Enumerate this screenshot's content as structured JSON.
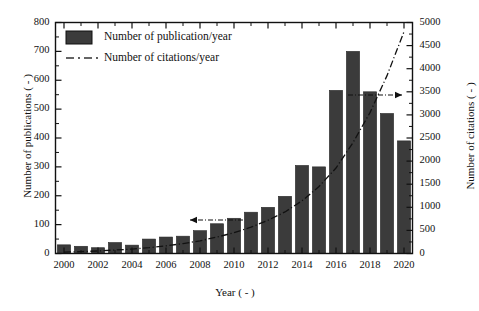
{
  "chart_data": {
    "type": "bar",
    "title": "",
    "xlabel": "Year ( - )",
    "ylabel": "Number of publications ( - )",
    "ylabel_right": "Number of citations ( - )",
    "xlim": [
      1999.5,
      2020.5
    ],
    "ylim": [
      0,
      800
    ],
    "ylim_right": [
      0,
      5000
    ],
    "grid": false,
    "legend_position": "upper-left-inside",
    "categories": [
      2000,
      2001,
      2002,
      2003,
      2004,
      2005,
      2006,
      2007,
      2008,
      2009,
      2010,
      2011,
      2012,
      2013,
      2014,
      2015,
      2016,
      2017,
      2018,
      2019,
      2020
    ],
    "xticks": [
      2000,
      2002,
      2004,
      2006,
      2008,
      2010,
      2012,
      2014,
      2016,
      2018,
      2020
    ],
    "yticks_left": [
      0,
      100,
      200,
      300,
      400,
      500,
      600,
      700,
      800
    ],
    "yticks_right": [
      0,
      500,
      1000,
      1500,
      2000,
      2500,
      3000,
      3500,
      4000,
      4500,
      5000
    ],
    "series": [
      {
        "name": "Number of publication/year",
        "type": "bar",
        "axis": "left",
        "color": "#3b3b3b",
        "values": [
          30,
          25,
          20,
          38,
          29,
          50,
          57,
          60,
          79,
          103,
          122,
          143,
          160,
          198,
          305,
          300,
          565,
          700,
          560,
          485,
          390
        ]
      },
      {
        "name": "Number of citations/year",
        "type": "line",
        "axis": "right",
        "color": "#111111",
        "linestyle": "dash-dot",
        "values": [
          30,
          40,
          55,
          75,
          95,
          125,
          165,
          215,
          275,
          355,
          450,
          570,
          720,
          900,
          1140,
          1450,
          1850,
          2400,
          3050,
          3850,
          4800
        ]
      }
    ],
    "annotations": [
      {
        "name": "left-axis-arrow",
        "direction": "left",
        "note": "bars read on left axis"
      },
      {
        "name": "right-axis-arrow",
        "direction": "right",
        "note": "line reads on right axis"
      }
    ]
  },
  "legend": {
    "items": [
      {
        "label": "Number of publication/year",
        "marker": "filled-rect"
      },
      {
        "label": "Number of citations/year",
        "marker": "dash-dot-line"
      }
    ]
  },
  "axes": {
    "x_title": "Year ( - )",
    "y_left_title": "Number of publications ( - )",
    "y_right_title": "Number of citations ( - )"
  }
}
